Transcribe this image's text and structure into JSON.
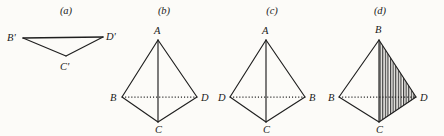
{
  "figure": {
    "background_color": "#fcfbf8",
    "ink_color": "#1f1f1f",
    "panels": [
      {
        "id": "a",
        "caption": "(a)",
        "caption_pos": {
          "x": 66,
          "y": 14
        },
        "type": "degenerate-triangle",
        "vertices": [
          {
            "name": "B-prime",
            "label": "B'",
            "x": 23,
            "y": 38,
            "label_x": 7,
            "label_y": 41
          },
          {
            "name": "D-prime",
            "label": "D'",
            "x": 103,
            "y": 37,
            "label_x": 106,
            "label_y": 40
          },
          {
            "name": "C-prime",
            "label": "C'",
            "x": 66,
            "y": 56,
            "label_x": 60,
            "label_y": 70
          }
        ],
        "edges": [
          {
            "from": "B-prime",
            "to": "D-prime",
            "style": "solid"
          },
          {
            "from": "B-prime",
            "to": "C-prime",
            "style": "solid"
          },
          {
            "from": "C-prime",
            "to": "D-prime",
            "style": "solid"
          }
        ]
      },
      {
        "id": "b",
        "caption": "(b)",
        "caption_pos": {
          "x": 164,
          "y": 14
        },
        "type": "tetrahedron",
        "vertices": [
          {
            "name": "A",
            "label": "A",
            "x": 158,
            "y": 40,
            "label_x": 154,
            "label_y": 34
          },
          {
            "name": "B",
            "label": "B",
            "x": 122,
            "y": 97,
            "label_x": 110,
            "label_y": 100
          },
          {
            "name": "D",
            "label": "D",
            "x": 197,
            "y": 97,
            "label_x": 201,
            "label_y": 100
          },
          {
            "name": "C",
            "label": "C",
            "x": 158,
            "y": 122,
            "label_x": 155,
            "label_y": 133
          }
        ],
        "edges": [
          {
            "from": "A",
            "to": "B",
            "style": "solid"
          },
          {
            "from": "A",
            "to": "D",
            "style": "solid"
          },
          {
            "from": "A",
            "to": "C",
            "style": "solid"
          },
          {
            "from": "B",
            "to": "C",
            "style": "solid"
          },
          {
            "from": "D",
            "to": "C",
            "style": "solid"
          },
          {
            "from": "B",
            "to": "D",
            "style": "dotted"
          }
        ]
      },
      {
        "id": "c",
        "caption": "(c)",
        "caption_pos": {
          "x": 272,
          "y": 14
        },
        "type": "tetrahedron",
        "vertices": [
          {
            "name": "A",
            "label": "A",
            "x": 266,
            "y": 40,
            "label_x": 262,
            "label_y": 34
          },
          {
            "name": "D",
            "label": "D",
            "x": 230,
            "y": 97,
            "label_x": 218,
            "label_y": 100
          },
          {
            "name": "B",
            "label": "B",
            "x": 305,
            "y": 97,
            "label_x": 309,
            "label_y": 100
          },
          {
            "name": "C",
            "label": "C",
            "x": 266,
            "y": 122,
            "label_x": 263,
            "label_y": 133
          }
        ],
        "edges": [
          {
            "from": "A",
            "to": "D",
            "style": "solid"
          },
          {
            "from": "A",
            "to": "B",
            "style": "solid"
          },
          {
            "from": "A",
            "to": "C",
            "style": "solid"
          },
          {
            "from": "D",
            "to": "C",
            "style": "solid"
          },
          {
            "from": "B",
            "to": "C",
            "style": "solid"
          },
          {
            "from": "D",
            "to": "B",
            "style": "dotted"
          }
        ]
      },
      {
        "id": "d",
        "caption": "(d)",
        "caption_pos": {
          "x": 380,
          "y": 14
        },
        "type": "tetrahedron-shaded",
        "shaded_face": "B-apex,D,C",
        "hatch_direction": "vertical",
        "vertices": [
          {
            "name": "B-apex",
            "label": "B",
            "x": 379,
            "y": 40,
            "label_x": 375,
            "label_y": 33
          },
          {
            "name": "B-left",
            "label": "B",
            "x": 339,
            "y": 97,
            "label_x": 328,
            "label_y": 100
          },
          {
            "name": "D",
            "label": "D",
            "x": 416,
            "y": 97,
            "label_x": 420,
            "label_y": 100
          },
          {
            "name": "C",
            "label": "C",
            "x": 379,
            "y": 122,
            "label_x": 376,
            "label_y": 133
          }
        ],
        "edges": [
          {
            "from": "B-apex",
            "to": "B-left",
            "style": "solid"
          },
          {
            "from": "B-apex",
            "to": "D",
            "style": "solid"
          },
          {
            "from": "B-apex",
            "to": "C",
            "style": "solid"
          },
          {
            "from": "B-left",
            "to": "C",
            "style": "solid"
          },
          {
            "from": "D",
            "to": "C",
            "style": "solid"
          },
          {
            "from": "B-left",
            "to": "D",
            "style": "dotted"
          }
        ]
      }
    ]
  }
}
